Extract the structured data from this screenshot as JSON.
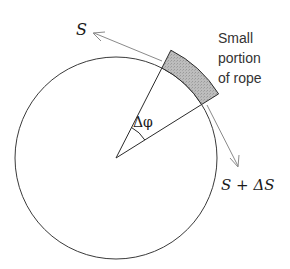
{
  "diagram": {
    "type": "physics-free-body",
    "labels": {
      "tension_in": "S",
      "tension_out": "S + ΔS",
      "angle": "Δφ",
      "segment_caption_lines": [
        "Small",
        "portion",
        "of rope"
      ]
    },
    "geometry": {
      "center": [
        116,
        158
      ],
      "circle_radius": 101,
      "rope_outer_radius": 121,
      "wedge_start_angle_deg": -63,
      "wedge_end_angle_deg": -32
    },
    "colors": {
      "line": "#3a3a3a",
      "arrow": "#8a8a8a",
      "rope_fill": "#b8b8b8",
      "background": "#ffffff"
    }
  }
}
